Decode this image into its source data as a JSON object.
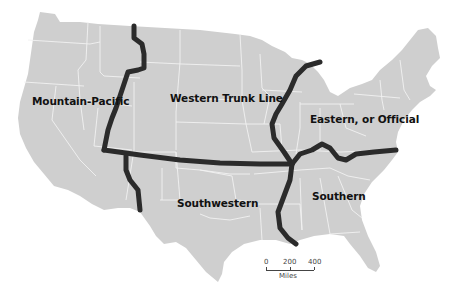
{
  "map": {
    "title": "",
    "subject": "U.S. railroad freight rate territories",
    "colors": {
      "land": "#cfcfcf",
      "state_borders": "#f2f2f2",
      "territory_boundaries": "#2b2b2b",
      "background": "#ffffff",
      "label_text": "#111111"
    },
    "regions": [
      {
        "id": "mountain-pacific",
        "label": "Mountain-Pacific"
      },
      {
        "id": "western-trunk-line",
        "label": "Western Trunk Line"
      },
      {
        "id": "eastern-official",
        "label": "Eastern, or Official"
      },
      {
        "id": "southwestern",
        "label": "Southwestern"
      },
      {
        "id": "southern",
        "label": "Southern"
      }
    ],
    "scale_bar": {
      "ticks": [
        "0",
        "200",
        "400"
      ],
      "unit": "Miles"
    }
  }
}
